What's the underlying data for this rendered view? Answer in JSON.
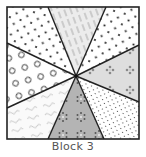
{
  "caption": "Block 3",
  "block": {
    "center": [
      76,
      76
    ],
    "bounds": [
      7,
      7,
      139,
      139
    ],
    "colors": {
      "outline": "#222222",
      "white": "#ffffff",
      "light_gray": "#e4e4e4",
      "mid_gray": "#b4b4b4",
      "dot": "#222222",
      "hatch": "#bdbdbd",
      "scribble": "#b0b0b0",
      "circle": "#333333",
      "flower": "#7a7a7a"
    },
    "wedges": [
      {
        "name": "top",
        "pattern": "diagonal-hatch"
      },
      {
        "name": "top-right",
        "pattern": "dots"
      },
      {
        "name": "right",
        "pattern": "flowers-light"
      },
      {
        "name": "bottom-right",
        "pattern": "small-dots"
      },
      {
        "name": "bottom",
        "pattern": "flowers-dark"
      },
      {
        "name": "bottom-left",
        "pattern": "scribbles"
      },
      {
        "name": "left",
        "pattern": "circles"
      },
      {
        "name": "top-left",
        "pattern": "dots"
      }
    ]
  }
}
